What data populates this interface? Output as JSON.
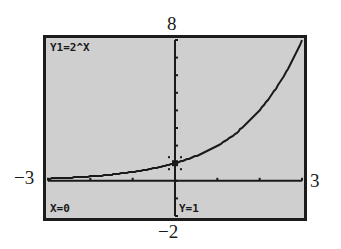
{
  "chart_data": {
    "type": "line",
    "title": "Y1=2^X",
    "function": "2^x",
    "x": [
      -3,
      -2.5,
      -2,
      -1.5,
      -1,
      -0.5,
      0,
      0.5,
      1,
      1.5,
      2,
      2.5,
      3
    ],
    "series": [
      {
        "name": "Y1=2^X",
        "values": [
          0.125,
          0.177,
          0.25,
          0.354,
          0.5,
          0.707,
          1,
          1.414,
          2,
          2.828,
          4,
          5.657,
          8
        ]
      }
    ],
    "xlabel": "",
    "ylabel": "",
    "xlim": [
      -3,
      3
    ],
    "ylim": [
      -2,
      8
    ],
    "xticks": [
      -3,
      -2,
      -1,
      0,
      1,
      2,
      3
    ],
    "yticks": [
      -2,
      -1,
      0,
      1,
      2,
      3,
      4,
      5,
      6,
      7,
      8
    ],
    "grid": false,
    "trace_point": {
      "x": 0,
      "y": 1
    }
  },
  "window_labels": {
    "xmin": "−3",
    "xmax": "3",
    "ymin": "−2",
    "ymax": "8"
  },
  "screen": {
    "equation": "Y1=2^X",
    "trace_x": "X=0",
    "trace_y": "Y=1"
  },
  "colors": {
    "screen_bg": "#cfcfcf",
    "ink": "#1a1a1a"
  }
}
